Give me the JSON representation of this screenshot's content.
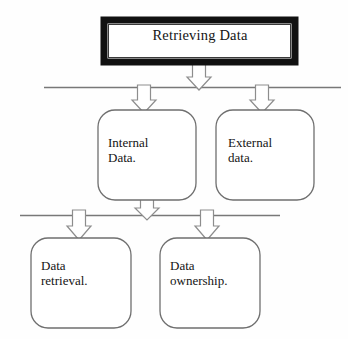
{
  "diagram": {
    "title": "Retrieving Data",
    "background_color": "#fefefe",
    "nodes": {
      "root": {
        "label": "Retrieving Data",
        "shape": "rectangle",
        "border_style": "thick-black",
        "border_color": "#111111",
        "fill_color": "#ffffff",
        "x": 104,
        "y": 20,
        "w": 191,
        "h": 42
      },
      "internal": {
        "label": "Internal\nData.",
        "shape": "rounded-rectangle",
        "border_style": "thin-gray",
        "border_color": "#6f6f6f",
        "fill_color": "#ffffff",
        "x": 98,
        "y": 110,
        "w": 98,
        "h": 90
      },
      "external": {
        "label": "External\ndata.",
        "shape": "rounded-rectangle",
        "border_style": "thin-gray",
        "border_color": "#6f6f6f",
        "fill_color": "#ffffff",
        "x": 216,
        "y": 110,
        "w": 98,
        "h": 90
      },
      "retrieval": {
        "label": "Data\nretrieval.",
        "shape": "rounded-rectangle",
        "border_style": "thin-gray",
        "border_color": "#6f6f6f",
        "fill_color": "#ffffff",
        "x": 31,
        "y": 238,
        "w": 100,
        "h": 90
      },
      "ownership": {
        "label": "Data\nownership.",
        "shape": "rounded-rectangle",
        "border_style": "thin-gray",
        "border_color": "#6f6f6f",
        "fill_color": "#ffffff",
        "x": 160,
        "y": 238,
        "w": 100,
        "h": 90
      }
    },
    "separator_lines": [
      {
        "name": "upper-separator",
        "x1": 44,
        "y1": 87,
        "x2": 341,
        "y2": 87,
        "color": "#787878"
      },
      {
        "name": "lower-separator",
        "x1": 20,
        "y1": 215,
        "x2": 280,
        "y2": 215,
        "color": "#787878"
      }
    ],
    "arrows": [
      {
        "name": "root-to-upper-separator",
        "cx": 199,
        "top": 62,
        "bottom": 88,
        "color": "#8a8a8a"
      },
      {
        "name": "upper-separator-to-internal",
        "cx": 144,
        "top": 87,
        "bottom": 111,
        "color": "#8a8a8a"
      },
      {
        "name": "upper-separator-to-external",
        "cx": 262,
        "top": 87,
        "bottom": 111,
        "color": "#8a8a8a"
      },
      {
        "name": "internal-to-lower-separator",
        "cx": 147,
        "top": 199,
        "bottom": 217,
        "color": "#8a8a8a"
      },
      {
        "name": "lower-separator-to-retrieval",
        "cx": 79,
        "top": 211,
        "bottom": 239,
        "color": "#8a8a8a"
      },
      {
        "name": "lower-separator-to-ownership",
        "cx": 207,
        "top": 211,
        "bottom": 239,
        "color": "#8a8a8a"
      }
    ]
  }
}
